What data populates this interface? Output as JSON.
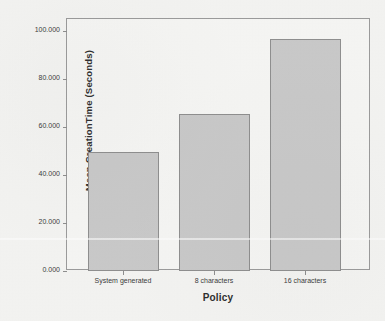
{
  "chart_data": {
    "type": "bar",
    "title": "",
    "subtitle": "",
    "xlabel": "Policy",
    "ylabel": "Mean CreationTime (Seconds)",
    "categories": [
      "System generated",
      "8 characters",
      "16 characters"
    ],
    "values": [
      49.5,
      65.5,
      96.5
    ],
    "ylim": [
      0,
      105
    ],
    "yticks": [
      0,
      20,
      40,
      60,
      80,
      100
    ],
    "ytick_labels": [
      "0.000",
      "20.000",
      "40.000",
      "60.000",
      "80.000",
      "100.000"
    ],
    "grid": false,
    "legend": false,
    "legend_position": "none",
    "bar_fill_color": "#c9c9c9",
    "bar_edge_color": "#8e8e8e",
    "plot_background_color": "#f6f6f4",
    "frame_color": "#9a9a9a",
    "text_color": "#2c2c2c"
  },
  "axes": {
    "y_title": "Mean CreationTime (Seconds)",
    "x_title": "Policy"
  },
  "ticks": {
    "y": [
      {
        "label": "100.000",
        "value": 100
      },
      {
        "label": "80.000",
        "value": 80
      },
      {
        "label": "60.000",
        "value": 60
      },
      {
        "label": "40.000",
        "value": 40
      },
      {
        "label": "20.000",
        "value": 20
      },
      {
        "label": "0.000",
        "value": 0
      }
    ],
    "x": [
      {
        "label": "System generated"
      },
      {
        "label": "8 characters"
      },
      {
        "label": "16 characters"
      }
    ]
  },
  "bars": [
    {
      "label": "System generated",
      "value": 49.5
    },
    {
      "label": "8 characters",
      "value": 65.5
    },
    {
      "label": "16 characters",
      "value": 96.5
    }
  ]
}
